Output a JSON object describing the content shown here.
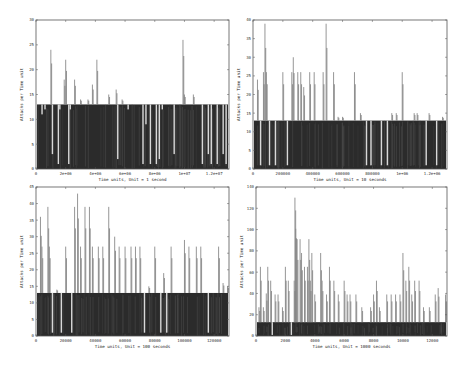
{
  "chart_data": [
    {
      "type": "bar",
      "title": "",
      "xlabel": "Time units, Unit = 1 second",
      "ylabel": "Attacks per Time unit",
      "xlim": [
        0,
        13000000
      ],
      "ylim": [
        0,
        30
      ],
      "xticks": [
        "0",
        "2e+06",
        "4e+06",
        "6e+06",
        "8e+06",
        "1e+07",
        "1.2e+07"
      ],
      "xtick_values": [
        0,
        2000000,
        4000000,
        6000000,
        8000000,
        10000000,
        12000000
      ],
      "yticks": [
        "0",
        "5",
        "10",
        "15",
        "20",
        "25",
        "30"
      ],
      "ytick_values": [
        0,
        5,
        10,
        15,
        20,
        25,
        30
      ],
      "baseline": 13,
      "spikes": [
        [
          400000,
          11
        ],
        [
          600000,
          12
        ],
        [
          1000000,
          24
        ],
        [
          1100000,
          3
        ],
        [
          1500000,
          1
        ],
        [
          1600000,
          12
        ],
        [
          1900000,
          18
        ],
        [
          2000000,
          22
        ],
        [
          2200000,
          1
        ],
        [
          2300000,
          12
        ],
        [
          2600000,
          18
        ],
        [
          3000000,
          14
        ],
        [
          3500000,
          14
        ],
        [
          3800000,
          17
        ],
        [
          4100000,
          22
        ],
        [
          4900000,
          15
        ],
        [
          5400000,
          16
        ],
        [
          5500000,
          2
        ],
        [
          5800000,
          14
        ],
        [
          6200000,
          12
        ],
        [
          7200000,
          1
        ],
        [
          7400000,
          9
        ],
        [
          7700000,
          1
        ],
        [
          8100000,
          1
        ],
        [
          8300000,
          2
        ],
        [
          8500000,
          12
        ],
        [
          9300000,
          3
        ],
        [
          9900000,
          26
        ],
        [
          10000000,
          15
        ],
        [
          10600000,
          15
        ],
        [
          11200000,
          1
        ],
        [
          11600000,
          3
        ],
        [
          11800000,
          1
        ],
        [
          12200000,
          1
        ],
        [
          12600000,
          3
        ],
        [
          12800000,
          1
        ]
      ]
    },
    {
      "type": "bar",
      "title": "",
      "xlabel": "Time units, Unit = 10 seconds",
      "ylabel": "Attacks per Time unit",
      "xlim": [
        0,
        1300000
      ],
      "ylim": [
        0,
        40
      ],
      "xticks": [
        "0",
        "200000",
        "400000",
        "600000",
        "800000",
        "1e+06",
        "1.2e+06"
      ],
      "xtick_values": [
        0,
        200000,
        400000,
        600000,
        800000,
        1000000,
        1200000
      ],
      "yticks": [
        "0",
        "5",
        "10",
        "15",
        "20",
        "25",
        "30",
        "35",
        "40"
      ],
      "ytick_values": [
        0,
        5,
        10,
        15,
        20,
        25,
        30,
        35,
        40
      ],
      "baseline": 13,
      "spikes": [
        [
          30000,
          24
        ],
        [
          50000,
          1
        ],
        [
          70000,
          26
        ],
        [
          80000,
          39
        ],
        [
          90000,
          26
        ],
        [
          110000,
          1
        ],
        [
          150000,
          1
        ],
        [
          200000,
          26
        ],
        [
          230000,
          1
        ],
        [
          260000,
          26
        ],
        [
          270000,
          30
        ],
        [
          300000,
          26
        ],
        [
          320000,
          26
        ],
        [
          340000,
          22
        ],
        [
          380000,
          26
        ],
        [
          410000,
          26
        ],
        [
          470000,
          26
        ],
        [
          490000,
          39
        ],
        [
          540000,
          26
        ],
        [
          570000,
          14
        ],
        [
          600000,
          14
        ],
        [
          680000,
          26
        ],
        [
          720000,
          15
        ],
        [
          760000,
          1
        ],
        [
          790000,
          1
        ],
        [
          860000,
          1
        ],
        [
          900000,
          1
        ],
        [
          930000,
          15
        ],
        [
          960000,
          15
        ],
        [
          1000000,
          26
        ],
        [
          1080000,
          15
        ],
        [
          1100000,
          15
        ],
        [
          1160000,
          1
        ],
        [
          1180000,
          15
        ],
        [
          1230000,
          1
        ],
        [
          1270000,
          14
        ]
      ]
    },
    {
      "type": "bar",
      "title": "",
      "xlabel": "Time units, Unit = 100 seconds",
      "ylabel": "Attacks per Time unit",
      "xlim": [
        0,
        130000
      ],
      "ylim": [
        0,
        45
      ],
      "xticks": [
        "0",
        "20000",
        "40000",
        "60000",
        "80000",
        "100000",
        "120000"
      ],
      "xtick_values": [
        0,
        20000,
        40000,
        60000,
        80000,
        100000,
        120000
      ],
      "yticks": [
        "0",
        "5",
        "10",
        "15",
        "20",
        "25",
        "30",
        "35",
        "40",
        "45"
      ],
      "ytick_values": [
        0,
        5,
        10,
        15,
        20,
        25,
        30,
        35,
        40,
        45
      ],
      "baseline": 13,
      "spikes": [
        [
          3000,
          36
        ],
        [
          4000,
          27
        ],
        [
          8000,
          39
        ],
        [
          9000,
          27
        ],
        [
          11000,
          1
        ],
        [
          14000,
          14
        ],
        [
          17000,
          1
        ],
        [
          20000,
          27
        ],
        [
          24000,
          1
        ],
        [
          26000,
          39
        ],
        [
          28000,
          43
        ],
        [
          30000,
          27
        ],
        [
          33000,
          39
        ],
        [
          36000,
          39
        ],
        [
          38000,
          27
        ],
        [
          42000,
          27
        ],
        [
          45000,
          27
        ],
        [
          49000,
          39
        ],
        [
          53000,
          30
        ],
        [
          56000,
          27
        ],
        [
          60000,
          27
        ],
        [
          64000,
          27
        ],
        [
          67000,
          27
        ],
        [
          70000,
          27
        ],
        [
          73000,
          1
        ],
        [
          76000,
          15
        ],
        [
          80000,
          27
        ],
        [
          84000,
          1
        ],
        [
          86000,
          19
        ],
        [
          88000,
          1
        ],
        [
          91000,
          27
        ],
        [
          100000,
          29
        ],
        [
          103000,
          27
        ],
        [
          108000,
          27
        ],
        [
          111000,
          27
        ],
        [
          116000,
          1
        ],
        [
          123000,
          27
        ],
        [
          126000,
          16
        ],
        [
          129000,
          15
        ]
      ]
    },
    {
      "type": "bar",
      "title": "",
      "xlabel": "Time units, Unit = 1000 seconds",
      "ylabel": "Attacks per Time unit",
      "xlim": [
        0,
        13000
      ],
      "ylim": [
        0,
        140
      ],
      "xticks": [
        "0",
        "2000",
        "4000",
        "6000",
        "8000",
        "10000",
        "12000"
      ],
      "xtick_values": [
        0,
        2000,
        4000,
        6000,
        8000,
        10000,
        12000
      ],
      "yticks": [
        "0",
        "20",
        "40",
        "60",
        "80",
        "100",
        "120",
        "140"
      ],
      "ytick_values": [
        0,
        20,
        40,
        60,
        80,
        100,
        120,
        140
      ],
      "baseline": 13,
      "spikes": [
        [
          200,
          27
        ],
        [
          300,
          65
        ],
        [
          500,
          27
        ],
        [
          700,
          40
        ],
        [
          800,
          65
        ],
        [
          1000,
          52
        ],
        [
          1100,
          1
        ],
        [
          1300,
          39
        ],
        [
          1500,
          39
        ],
        [
          1800,
          27
        ],
        [
          2000,
          65
        ],
        [
          2200,
          52
        ],
        [
          2400,
          1
        ],
        [
          2600,
          52
        ],
        [
          2650,
          130
        ],
        [
          2700,
          118
        ],
        [
          2800,
          91
        ],
        [
          3000,
          91
        ],
        [
          3100,
          78
        ],
        [
          3300,
          65
        ],
        [
          3500,
          65
        ],
        [
          3600,
          91
        ],
        [
          3700,
          52
        ],
        [
          3800,
          78
        ],
        [
          4000,
          39
        ],
        [
          4400,
          78
        ],
        [
          4500,
          52
        ],
        [
          4800,
          39
        ],
        [
          5000,
          65
        ],
        [
          5300,
          52
        ],
        [
          5600,
          39
        ],
        [
          6000,
          52
        ],
        [
          6200,
          39
        ],
        [
          6400,
          39
        ],
        [
          6800,
          39
        ],
        [
          7200,
          27
        ],
        [
          7500,
          13
        ],
        [
          7800,
          27
        ],
        [
          8000,
          39
        ],
        [
          8200,
          52
        ],
        [
          8400,
          27
        ],
        [
          8600,
          13
        ],
        [
          8900,
          39
        ],
        [
          9200,
          39
        ],
        [
          9500,
          39
        ],
        [
          9800,
          39
        ],
        [
          10000,
          78
        ],
        [
          10200,
          52
        ],
        [
          10400,
          65
        ],
        [
          10600,
          39
        ],
        [
          10800,
          52
        ],
        [
          11100,
          52
        ],
        [
          11400,
          27
        ],
        [
          11800,
          27
        ],
        [
          12000,
          13
        ],
        [
          12200,
          39
        ],
        [
          12400,
          45
        ],
        [
          12600,
          13
        ],
        [
          12900,
          39
        ]
      ]
    }
  ]
}
